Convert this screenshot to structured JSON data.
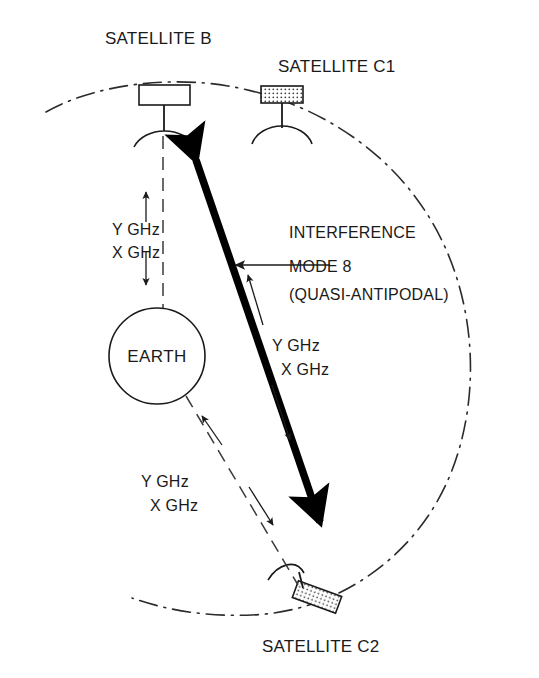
{
  "figure": {
    "background_color": "#ffffff",
    "line_color": "#1a1a1a"
  },
  "labels": {
    "satellite_b": "SATELLITE B",
    "satellite_c1": "SATELLITE C1",
    "satellite_c2": "SATELLITE C2",
    "earth": "EARTH",
    "interference_line1": "INTERFERENCE",
    "interference_line2": "MODE 8",
    "interference_line3": "(QUASI-ANTIPODAL)"
  },
  "links": {
    "earth_to_b": {
      "uplink_band": "Y GHz",
      "downlink_band": "X GHz"
    },
    "beam_mid": {
      "uplink_band": "Y GHz",
      "downlink_band": "X GHz"
    },
    "earth_to_c2": {
      "uplink_band": "Y GHz",
      "downlink_band": "X GHz"
    }
  },
  "icons": {
    "satellite_b": "satellite-icon",
    "satellite_c1": "satellite-icon",
    "satellite_c2": "satellite-icon",
    "orbit": "orbit-path-icon",
    "interference_beam": "double-arrow-icon",
    "callout": "callout-arrow-icon"
  }
}
